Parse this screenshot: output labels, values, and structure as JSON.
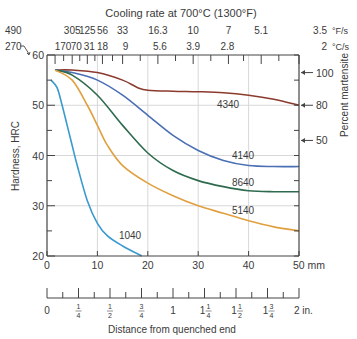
{
  "chart_data": {
    "type": "line",
    "title": "Cooling rate at 700°C (1300°F)",
    "xlabel": "Distance from quenched end",
    "ylabel": "Hardness, HRC",
    "y2label": "Percent martensite",
    "xlim": [
      0,
      50
    ],
    "ylim": [
      20,
      60
    ],
    "grid": true,
    "x_ticks_mm": [
      "0",
      "10",
      "20",
      "30",
      "40",
      "50 mm"
    ],
    "y_ticks": [
      "20",
      "30",
      "40",
      "50",
      "60"
    ],
    "top_axis": {
      "row_F": [
        "490",
        "305",
        "125",
        "56",
        "33",
        "16.3",
        "10",
        "7",
        "5.1",
        "3.5"
      ],
      "unit_F": "°F/s",
      "row_C": [
        "270",
        "170",
        "70",
        "31",
        "18",
        "9",
        "5.6",
        "3.9",
        "2.8",
        "2"
      ],
      "unit_C": "°C/s"
    },
    "inch_axis": {
      "ticks": [
        "0",
        "1/4",
        "1/2",
        "3/4",
        "1",
        "1 1/4",
        "1 1/2",
        "1 3/4",
        "2 in."
      ]
    },
    "martensite_markers": [
      {
        "label": "100",
        "hrc": 56.5
      },
      {
        "label": "80",
        "hrc": 50
      },
      {
        "label": "50",
        "hrc": 43
      }
    ],
    "series": [
      {
        "name": "4340",
        "color": "#8b3a2e",
        "x": [
          1.6,
          5,
          10,
          15,
          18,
          20,
          25,
          30,
          35,
          40,
          45,
          50
        ],
        "y": [
          57,
          57,
          56.5,
          55,
          53.5,
          53,
          52.8,
          52.7,
          52.5,
          52,
          51.2,
          50
        ]
      },
      {
        "name": "4140",
        "color": "#4a6fb5",
        "x": [
          1.6,
          5,
          10,
          15,
          20,
          25,
          30,
          35,
          40,
          45,
          50
        ],
        "y": [
          57,
          56.5,
          55,
          52,
          48,
          44,
          41,
          39,
          38,
          37.8,
          37.8
        ]
      },
      {
        "name": "8640",
        "color": "#2e6b4e",
        "x": [
          1.6,
          5,
          10,
          15,
          20,
          25,
          30,
          35,
          40,
          45,
          50
        ],
        "y": [
          57,
          56,
          52,
          46,
          40.5,
          37,
          35,
          33.8,
          33,
          32.8,
          32.8
        ]
      },
      {
        "name": "5140",
        "color": "#e0a040",
        "x": [
          1.6,
          5,
          8,
          10,
          12,
          15,
          20,
          25,
          30,
          35,
          40,
          45,
          50
        ],
        "y": [
          57,
          55,
          50,
          46,
          42,
          38,
          34.5,
          32,
          30,
          28.5,
          27,
          25.8,
          25
        ]
      },
      {
        "name": "1040",
        "color": "#3a9ad0",
        "x": [
          0.8,
          2,
          3,
          4,
          5,
          6,
          8,
          10,
          12,
          15,
          18.8
        ],
        "y": [
          55,
          53.5,
          50,
          46,
          42,
          38,
          31,
          26.5,
          24,
          22,
          20
        ]
      }
    ]
  },
  "labels": {
    "title": "Cooling rate at 700°C (1300°F)",
    "ylabel": "Hardness, HRC",
    "y2label": "Percent martensite",
    "xlabel": "Distance from quenched end",
    "unit_F": "°F/s",
    "unit_C": "°C/s",
    "s4340": "4340",
    "s4140": "4140",
    "s8640": "8640",
    "s5140": "5140",
    "s1040": "1040"
  }
}
